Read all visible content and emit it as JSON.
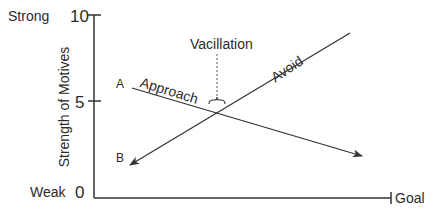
{
  "diagram": {
    "y_axis": {
      "label": "Strength of Motives",
      "ticks": [
        {
          "value": "10",
          "descriptor": "Strong"
        },
        {
          "value": "5",
          "descriptor": ""
        },
        {
          "value": "0",
          "descriptor": "Weak"
        }
      ]
    },
    "x_axis": {
      "end_label": "Goal"
    },
    "lines": [
      {
        "name": "Approach",
        "start_label": "A",
        "direction": "decreasing toward goal"
      },
      {
        "name": "Avoid",
        "start_label": "B",
        "direction": "increasing toward goal"
      }
    ],
    "annotation": "Vacillation",
    "colors": {
      "stroke": "#333333",
      "text": "#2b2b2b"
    }
  }
}
